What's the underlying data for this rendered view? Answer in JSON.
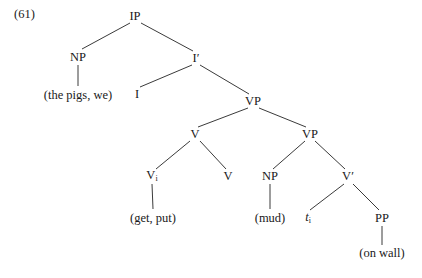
{
  "figure": {
    "example_number": "(61)",
    "type": "syntax-tree",
    "ink_color": "#242424",
    "background_color": "#ffffff"
  },
  "nodes": [
    {
      "id": "ip",
      "label": "IP",
      "sub": "",
      "x": 135,
      "y": 16,
      "kind": "category"
    },
    {
      "id": "np1",
      "label": "NP",
      "sub": "",
      "x": 78,
      "y": 57,
      "kind": "category"
    },
    {
      "id": "ibar",
      "label": "I′",
      "sub": "",
      "x": 196,
      "y": 58,
      "kind": "category"
    },
    {
      "id": "np1-leaf",
      "label": "(the pigs, we)",
      "sub": "",
      "x": 78,
      "y": 95,
      "kind": "leaf"
    },
    {
      "id": "i",
      "label": "I",
      "sub": "",
      "x": 137,
      "y": 94,
      "kind": "category"
    },
    {
      "id": "vp1",
      "label": "VP",
      "sub": "",
      "x": 253,
      "y": 101,
      "kind": "category"
    },
    {
      "id": "v1",
      "label": "V",
      "sub": "",
      "x": 195,
      "y": 134,
      "kind": "category"
    },
    {
      "id": "vp2",
      "label": "VP",
      "sub": "",
      "x": 310,
      "y": 134,
      "kind": "category"
    },
    {
      "id": "vi",
      "label": "V",
      "sub": "i",
      "x": 152,
      "y": 176,
      "kind": "category"
    },
    {
      "id": "v2",
      "label": "V",
      "sub": "",
      "x": 228,
      "y": 176,
      "kind": "category"
    },
    {
      "id": "np2",
      "label": "NP",
      "sub": "",
      "x": 270,
      "y": 176,
      "kind": "category"
    },
    {
      "id": "vbar",
      "label": "V′",
      "sub": "",
      "x": 348,
      "y": 176,
      "kind": "category"
    },
    {
      "id": "vi-leaf",
      "label": "(get, put)",
      "sub": "",
      "x": 153,
      "y": 218,
      "kind": "leaf"
    },
    {
      "id": "np2-leaf",
      "label": "(mud)",
      "sub": "",
      "x": 270,
      "y": 218,
      "kind": "leaf"
    },
    {
      "id": "trace",
      "label": "t",
      "sub": "i",
      "x": 308,
      "y": 218,
      "kind": "trace"
    },
    {
      "id": "pp",
      "label": "PP",
      "sub": "",
      "x": 382,
      "y": 218,
      "kind": "category"
    },
    {
      "id": "pp-leaf",
      "label": "(on wall)",
      "sub": "",
      "x": 382,
      "y": 253,
      "kind": "leaf"
    }
  ],
  "edges": [
    {
      "from": "ip",
      "to": "np1",
      "x1": 130,
      "y1": 23,
      "x2": 82,
      "y2": 49
    },
    {
      "from": "ip",
      "to": "ibar",
      "x1": 141,
      "y1": 23,
      "x2": 193,
      "y2": 51
    },
    {
      "from": "np1",
      "to": "np1-leaf",
      "x1": 78,
      "y1": 65,
      "x2": 78,
      "y2": 86
    },
    {
      "from": "ibar",
      "to": "i",
      "x1": 192,
      "y1": 65,
      "x2": 140,
      "y2": 87
    },
    {
      "from": "ibar",
      "to": "vp1",
      "x1": 200,
      "y1": 65,
      "x2": 249,
      "y2": 94
    },
    {
      "from": "vp1",
      "to": "v1",
      "x1": 248,
      "y1": 108,
      "x2": 198,
      "y2": 127
    },
    {
      "from": "vp1",
      "to": "vp2",
      "x1": 259,
      "y1": 108,
      "x2": 306,
      "y2": 127
    },
    {
      "from": "v1",
      "to": "vi",
      "x1": 190,
      "y1": 141,
      "x2": 156,
      "y2": 169
    },
    {
      "from": "v1",
      "to": "v2",
      "x1": 200,
      "y1": 141,
      "x2": 226,
      "y2": 169
    },
    {
      "from": "vi",
      "to": "vi-leaf",
      "x1": 152,
      "y1": 184,
      "x2": 153,
      "y2": 209
    },
    {
      "from": "vp2",
      "to": "np2",
      "x1": 305,
      "y1": 141,
      "x2": 273,
      "y2": 169
    },
    {
      "from": "vp2",
      "to": "vbar",
      "x1": 315,
      "y1": 141,
      "x2": 345,
      "y2": 169
    },
    {
      "from": "np2",
      "to": "np2-leaf",
      "x1": 270,
      "y1": 184,
      "x2": 270,
      "y2": 209
    },
    {
      "from": "vbar",
      "to": "trace",
      "x1": 344,
      "y1": 184,
      "x2": 310,
      "y2": 210
    },
    {
      "from": "vbar",
      "to": "pp",
      "x1": 353,
      "y1": 184,
      "x2": 379,
      "y2": 210
    },
    {
      "from": "pp",
      "to": "pp-leaf",
      "x1": 382,
      "y1": 226,
      "x2": 382,
      "y2": 245
    }
  ]
}
